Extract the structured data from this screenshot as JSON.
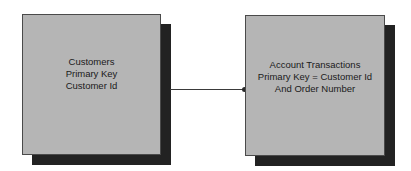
{
  "diagram": {
    "type": "entity-relationship",
    "entities": [
      {
        "id": "customers",
        "lines": [
          "Customers",
          "Primary Key",
          "Customer Id"
        ]
      },
      {
        "id": "account-transactions",
        "lines": [
          "Account Transactions",
          "Primary Key = Customer Id",
          "And Order Number"
        ]
      }
    ],
    "relationships": [
      {
        "from": "customers",
        "to": "account-transactions",
        "end_marker": "dot"
      }
    ],
    "colors": {
      "box_fill": "#b5b5b5",
      "box_border": "#4a4a4a",
      "shadow": "#222222",
      "connector": "#3a3a3a",
      "background": "#ffffff"
    }
  }
}
